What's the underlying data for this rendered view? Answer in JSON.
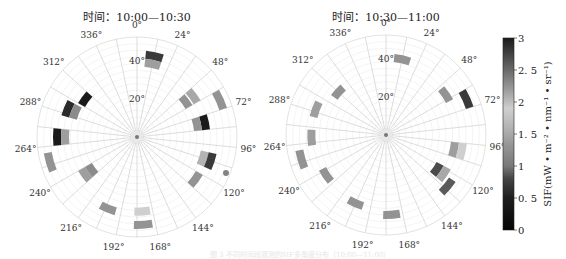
{
  "chart_data": [
    {
      "type": "polar-heatmap",
      "title": "时间：10:00—10:30",
      "center": [
        137,
        137
      ],
      "radius_px": 100,
      "max_zenith_deg": 75,
      "azimuth_ticks": [
        "0°",
        "24°",
        "48°",
        "72°",
        "96°",
        "120°",
        "144°",
        "168°",
        "192°",
        "216°",
        "240°",
        "264°",
        "288°",
        "312°",
        "336°"
      ],
      "azimuth_tick_values": [
        0,
        24,
        48,
        72,
        96,
        120,
        144,
        168,
        192,
        216,
        240,
        264,
        288,
        312,
        336
      ],
      "radial_tick_labels": [
        "20°",
        "40°"
      ],
      "radial_tick_values": [
        20,
        40
      ],
      "patches": [
        {
          "az": 12,
          "zen": 62,
          "value": 2.8
        },
        {
          "az": 12,
          "zen": 56,
          "value": 1.4
        },
        {
          "az": 306,
          "zen": 48,
          "value": 3.0
        },
        {
          "az": 292,
          "zen": 56,
          "value": 2.9
        },
        {
          "az": 292,
          "zen": 50,
          "value": 1.2
        },
        {
          "az": 54,
          "zen": 52,
          "value": 1.5
        },
        {
          "az": 54,
          "zen": 45,
          "value": 1.3
        },
        {
          "az": 66,
          "zen": 68,
          "value": 1.3
        },
        {
          "az": 78,
          "zen": 52,
          "value": 3.0
        },
        {
          "az": 78,
          "zen": 46,
          "value": 1.3
        },
        {
          "az": 270,
          "zen": 60,
          "value": 3.0
        },
        {
          "az": 270,
          "zen": 54,
          "value": 1.4
        },
        {
          "az": 254,
          "zen": 68,
          "value": 1.3
        },
        {
          "az": 234,
          "zen": 48,
          "value": 1.4
        },
        {
          "az": 234,
          "zen": 42,
          "value": 1.2
        },
        {
          "az": 108,
          "zen": 52,
          "value": 1.6
        },
        {
          "az": 108,
          "zen": 58,
          "value": 2.8
        },
        {
          "az": 126,
          "zen": 54,
          "value": 1.3
        },
        {
          "az": 202,
          "zen": 58,
          "value": 1.3
        },
        {
          "az": 176,
          "zen": 56,
          "value": 1.9
        },
        {
          "az": 176,
          "zen": 66,
          "value": 1.3
        }
      ],
      "markers": [
        {
          "az": 112,
          "zen": 72,
          "value": 1.1
        }
      ]
    },
    {
      "type": "polar-heatmap",
      "title": "时间：10:30—11:00",
      "center": [
        386,
        135
      ],
      "radius_px": 100,
      "max_zenith_deg": 75,
      "azimuth_ticks": [
        "0°",
        "24°",
        "48°",
        "72°",
        "96°",
        "120°",
        "144°",
        "168°",
        "192°",
        "216°",
        "240°",
        "264°",
        "288°",
        "312°",
        "336°"
      ],
      "azimuth_tick_values": [
        0,
        24,
        48,
        72,
        96,
        120,
        144,
        168,
        192,
        216,
        240,
        264,
        288,
        312,
        336
      ],
      "radial_tick_labels": [
        "20°",
        "40°"
      ],
      "radial_tick_values": [
        20,
        40
      ],
      "patches": [
        {
          "az": 12,
          "zen": 58,
          "value": 1.3
        },
        {
          "az": 312,
          "zen": 48,
          "value": 1.3
        },
        {
          "az": 290,
          "zen": 56,
          "value": 1.4
        },
        {
          "az": 56,
          "zen": 54,
          "value": 1.3
        },
        {
          "az": 66,
          "zen": 66,
          "value": 2.8
        },
        {
          "az": 268,
          "zen": 56,
          "value": 1.4
        },
        {
          "az": 254,
          "zen": 66,
          "value": 1.3
        },
        {
          "az": 236,
          "zen": 54,
          "value": 1.3
        },
        {
          "az": 102,
          "zen": 52,
          "value": 1.4
        },
        {
          "az": 102,
          "zen": 58,
          "value": 1.9
        },
        {
          "az": 124,
          "zen": 46,
          "value": 2.7
        },
        {
          "az": 124,
          "zen": 52,
          "value": 1.5
        },
        {
          "az": 130,
          "zen": 60,
          "value": 2.6
        },
        {
          "az": 204,
          "zen": 56,
          "value": 1.3
        },
        {
          "az": 176,
          "zen": 60,
          "value": 1.3
        }
      ],
      "markers": []
    }
  ],
  "colorbar": {
    "min": 0,
    "max": 3,
    "ticks": [
      "0",
      "0. 5",
      "1",
      "1. 5",
      "2",
      "2. 5",
      "3"
    ],
    "tick_values": [
      0,
      0.5,
      1,
      1.5,
      2,
      2.5,
      3
    ],
    "label": "SIF(mW • m⁻² • nm⁻¹ • sr⁻¹)",
    "stops": [
      {
        "v": 0.0,
        "color": "#050505"
      },
      {
        "v": 0.5,
        "color": "#1e1e1e"
      },
      {
        "v": 0.8,
        "color": "#444444"
      },
      {
        "v": 1.0,
        "color": "#7a7a7a"
      },
      {
        "v": 1.3,
        "color": "#939393"
      },
      {
        "v": 1.6,
        "color": "#b3b3b3"
      },
      {
        "v": 1.9,
        "color": "#cfcfcf"
      },
      {
        "v": 2.2,
        "color": "#9a9a9a"
      },
      {
        "v": 2.6,
        "color": "#5a5a5a"
      },
      {
        "v": 3.0,
        "color": "#1a1a1a"
      }
    ]
  },
  "caption": "图 3  不同时间段观测的SIF多角度分布（10:00—11:00）"
}
